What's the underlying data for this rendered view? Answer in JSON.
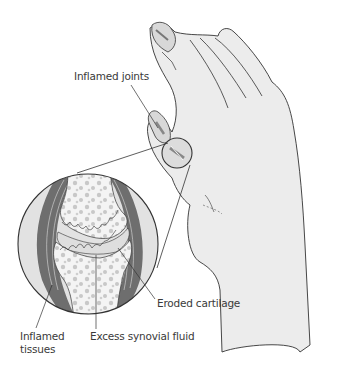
{
  "diagram": {
    "labels": {
      "inflamed_joints": "Inflamed joints",
      "eroded_cartilage": "Eroded cartilage",
      "excess_synovial_fluid": "Excess synovial fluid",
      "inflamed_tissues": "Inflamed\ntissues"
    },
    "colors": {
      "outline": "#333333",
      "skin_fill": "#ececec",
      "bone_fill": "#f4f4f4",
      "bone_spots": "#c8c8c8",
      "tissue_dark": "#6e6e6e",
      "fluid_fill": "#dedede",
      "background": "#ffffff"
    }
  }
}
